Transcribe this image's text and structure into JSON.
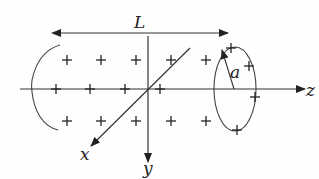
{
  "diagram": {
    "colors": {
      "stroke": "#333333",
      "text": "#222222",
      "background": "#fefefe"
    },
    "labels": {
      "length": "L",
      "radius": "a",
      "z_axis": "z",
      "y_axis": "y",
      "x_axis": "x"
    },
    "charge_symbol": "+",
    "charges": [
      {
        "x": 67,
        "y": 60
      },
      {
        "x": 101,
        "y": 60
      },
      {
        "x": 136,
        "y": 60
      },
      {
        "x": 171,
        "y": 60
      },
      {
        "x": 206,
        "y": 60
      },
      {
        "x": 56,
        "y": 89
      },
      {
        "x": 90,
        "y": 89
      },
      {
        "x": 125,
        "y": 89
      },
      {
        "x": 160,
        "y": 89
      },
      {
        "x": 67,
        "y": 121
      },
      {
        "x": 101,
        "y": 121
      },
      {
        "x": 136,
        "y": 121
      },
      {
        "x": 171,
        "y": 121
      },
      {
        "x": 206,
        "y": 121
      },
      {
        "x": 231,
        "y": 48
      },
      {
        "x": 249,
        "y": 66
      },
      {
        "x": 255,
        "y": 97
      },
      {
        "x": 237,
        "y": 130
      }
    ]
  }
}
